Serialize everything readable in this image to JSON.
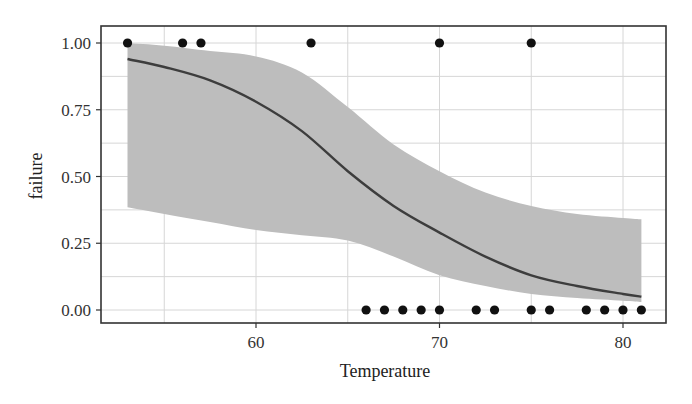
{
  "chart_data": {
    "type": "scatter",
    "title": "",
    "xlabel": "Temperature",
    "ylabel": "failure",
    "xlim": [
      51.8,
      82.3
    ],
    "ylim": [
      -0.04,
      1.05
    ],
    "x_ticks": [
      60,
      70,
      80
    ],
    "x_tick_labels": [
      "60",
      "70",
      "80"
    ],
    "y_ticks": [
      0.0,
      0.25,
      0.5,
      0.75,
      1.0
    ],
    "y_tick_labels": [
      "0.00",
      "0.25",
      "0.50",
      "0.75",
      "1.00"
    ],
    "grid": {
      "major_x": [
        55,
        60,
        65,
        70,
        75,
        80
      ],
      "major_y": [
        0,
        0.125,
        0.25,
        0.375,
        0.5,
        0.625,
        0.75,
        0.875,
        1.0
      ]
    },
    "legend": null,
    "colors": {
      "points": "#111111",
      "fit_line": "#3d3d3d",
      "ribbon": "#bdbdbd",
      "grid": "#d6d6d6",
      "frame": "#333333"
    },
    "series": [
      {
        "name": "observations",
        "type": "scatter",
        "points": [
          [
            53,
            1
          ],
          [
            56,
            1
          ],
          [
            57,
            1
          ],
          [
            63,
            1
          ],
          [
            70,
            1
          ],
          [
            75,
            1
          ],
          [
            66,
            0
          ],
          [
            67,
            0
          ],
          [
            68,
            0
          ],
          [
            69,
            0
          ],
          [
            70,
            0
          ],
          [
            72,
            0
          ],
          [
            73,
            0
          ],
          [
            75,
            0
          ],
          [
            76,
            0
          ],
          [
            78,
            0
          ],
          [
            79,
            0
          ],
          [
            80,
            0
          ],
          [
            81,
            0
          ]
        ]
      },
      {
        "name": "logistic fit",
        "type": "line",
        "x": [
          53,
          55,
          57.5,
          60,
          62.5,
          65,
          67.5,
          70,
          72.5,
          75,
          77.5,
          80,
          81
        ],
        "y": [
          0.94,
          0.91,
          0.86,
          0.78,
          0.67,
          0.52,
          0.39,
          0.29,
          0.2,
          0.13,
          0.09,
          0.06,
          0.05
        ]
      },
      {
        "name": "confidence band",
        "type": "area",
        "x": [
          53,
          55,
          57.5,
          60,
          62.5,
          65,
          67.5,
          70,
          72.5,
          75,
          77.5,
          80,
          81
        ],
        "lower": [
          0.385,
          0.36,
          0.33,
          0.3,
          0.28,
          0.26,
          0.2,
          0.13,
          0.09,
          0.06,
          0.045,
          0.035,
          0.03
        ],
        "upper": [
          1.0,
          0.99,
          0.97,
          0.95,
          0.89,
          0.76,
          0.62,
          0.52,
          0.44,
          0.39,
          0.36,
          0.345,
          0.34
        ]
      }
    ]
  },
  "layout": {
    "plot": {
      "left": 101,
      "top": 26,
      "right": 666,
      "bottom": 323
    },
    "x_map": {
      "value": 60,
      "px": 256,
      "px_per_unit": 18.35
    },
    "y_map": {
      "zero_px": 310,
      "one_px": 43
    }
  }
}
